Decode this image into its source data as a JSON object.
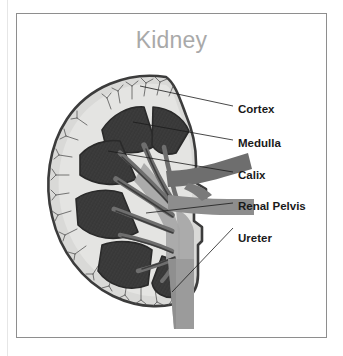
{
  "figure": {
    "title": "Kidney",
    "title_color": "#a9a9a9",
    "background_color": "#ffffff",
    "frame_color": "#8e8e8e",
    "label_color": "#1a1a1a",
    "leader_line_color": "#1a1a1a"
  },
  "palette": {
    "capsule_outline": "#3c3c3c",
    "cortex_fill": "#d9d9d7",
    "cortex_inner": "#e4e4e2",
    "medulla_pyramid": "#3a3a3a",
    "pyramid_outline": "#2a2a2a",
    "vessel_mid_gray": "#8d8d8d",
    "vessel_dark_gray": "#6e6e6e",
    "pelvis_fill": "#a6a6a6",
    "ureter_fill": "#9b9b9b",
    "vessel_fine": "#555555"
  },
  "labels": [
    {
      "id": "cortex",
      "text": "Cortex",
      "x": 238,
      "y": 104
    },
    {
      "id": "medulla",
      "text": "Medulla",
      "x": 238,
      "y": 138
    },
    {
      "id": "calix",
      "text": "Calix",
      "x": 238,
      "y": 170
    },
    {
      "id": "renal-pelvis",
      "text": "Renal Pelvis",
      "x": 238,
      "y": 201
    },
    {
      "id": "ureter",
      "text": "Ureter",
      "x": 238,
      "y": 233
    }
  ],
  "leader_lines": [
    {
      "id": "cortex-leader",
      "x1": 233,
      "y1": 106,
      "x2": 140,
      "y2": 86
    },
    {
      "id": "medulla-leader",
      "x1": 233,
      "y1": 140,
      "x2": 133,
      "y2": 122
    },
    {
      "id": "calix-leader",
      "x1": 233,
      "y1": 172,
      "x2": 108,
      "y2": 151
    },
    {
      "id": "renal-pelvis-leader",
      "x1": 233,
      "y1": 203,
      "x2": 146,
      "y2": 213
    },
    {
      "id": "ureter-leader",
      "x1": 233,
      "y1": 228,
      "x2": 172,
      "y2": 292
    }
  ],
  "anatomy": {
    "organ": "kidney",
    "view": "coronal cross-section",
    "structures": [
      "renal capsule",
      "cortex",
      "medullary pyramids",
      "minor calix",
      "major calix",
      "renal pelvis",
      "renal artery",
      "renal vein",
      "ureter"
    ],
    "pyramid_count": 5
  }
}
